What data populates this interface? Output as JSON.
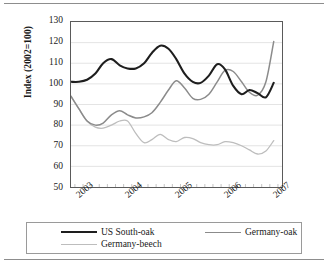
{
  "chart_data": {
    "type": "line",
    "title": "",
    "xlabel": "",
    "ylabel": "Index (2002=100)",
    "ylim": [
      50,
      130
    ],
    "yticks": [
      130,
      120,
      110,
      100,
      90,
      80,
      70,
      60,
      50
    ],
    "xticks": [
      "2003",
      "2004",
      "2005",
      "2006",
      "2007"
    ],
    "xlim": [
      2002.67,
      2007.0
    ],
    "grid": "horizontal",
    "legend_position": "bottom",
    "series": [
      {
        "name": "US South-oak",
        "color": "#1e1e1e",
        "x": [
          2002.67,
          2002.83,
          2003.0,
          2003.17,
          2003.33,
          2003.5,
          2003.67,
          2003.83,
          2004.0,
          2004.17,
          2004.33,
          2004.5,
          2004.67,
          2004.83,
          2005.0,
          2005.17,
          2005.33,
          2005.5,
          2005.67,
          2005.83,
          2006.0,
          2006.17,
          2006.33,
          2006.5,
          2006.67,
          2006.83
        ],
        "values": [
          101,
          101,
          102,
          105,
          110,
          112,
          109,
          107.5,
          107.5,
          110,
          115,
          118.5,
          117,
          112,
          105,
          101,
          100.5,
          104,
          109.5,
          107,
          99,
          95,
          97,
          95.5,
          93.5,
          100.5
        ]
      },
      {
        "name": "Germany-oak",
        "color": "#8b8b8b",
        "x": [
          2002.67,
          2002.83,
          2003.0,
          2003.17,
          2003.33,
          2003.5,
          2003.67,
          2003.83,
          2004.0,
          2004.17,
          2004.33,
          2004.5,
          2004.67,
          2004.83,
          2005.0,
          2005.17,
          2005.33,
          2005.5,
          2005.67,
          2005.83,
          2006.0,
          2006.17,
          2006.33,
          2006.5,
          2006.67,
          2006.83
        ],
        "values": [
          94,
          88,
          82,
          80,
          81,
          85,
          87,
          85,
          83.5,
          84,
          86,
          91,
          97,
          101.5,
          98,
          93,
          92.5,
          95,
          101,
          106.5,
          106,
          101,
          96,
          94.5,
          101,
          120.5
        ]
      },
      {
        "name": "Germany-beech",
        "color": "#bdbdbd",
        "x": [
          2002.67,
          2002.83,
          2003.0,
          2003.17,
          2003.33,
          2003.5,
          2003.67,
          2003.83,
          2004.0,
          2004.17,
          2004.33,
          2004.5,
          2004.67,
          2004.83,
          2005.0,
          2005.17,
          2005.33,
          2005.5,
          2005.67,
          2005.83,
          2006.0,
          2006.17,
          2006.33,
          2006.5,
          2006.67,
          2006.83
        ],
        "values": [
          94,
          88,
          82,
          79,
          78.5,
          80,
          82,
          82,
          76,
          71.5,
          73,
          75.5,
          73,
          72,
          74,
          73.5,
          71.5,
          70.5,
          70.5,
          72,
          71.5,
          70,
          68,
          66,
          67.5,
          72.5
        ]
      }
    ]
  },
  "legend": {
    "items": [
      {
        "label": "US South-oak"
      },
      {
        "label": "Germany-oak"
      },
      {
        "label": "Germany-beech"
      }
    ]
  }
}
